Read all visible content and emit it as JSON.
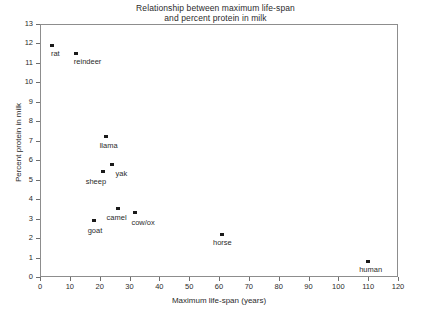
{
  "chart_data": {
    "type": "scatter",
    "title": "Relationship between maximum life-span and percent protein in milk",
    "title_line1": "Relationship between maximum life-span",
    "title_line2": "and percent protein in milk",
    "xlabel": "Maximum life-span (years)",
    "ylabel": "Percent protein in milk",
    "xlim": [
      0,
      120
    ],
    "ylim": [
      0,
      13
    ],
    "xticks": [
      0,
      10,
      20,
      30,
      40,
      50,
      60,
      70,
      80,
      90,
      100,
      110,
      120
    ],
    "yticks": [
      0,
      1,
      2,
      3,
      4,
      5,
      6,
      7,
      8,
      9,
      10,
      11,
      12,
      13
    ],
    "grid": false,
    "legend": "none",
    "marker": "filled-square",
    "marker_color": "#1a1a1a",
    "points": [
      {
        "label": "rat",
        "x": 4,
        "y": 11.9,
        "label_dx": -1,
        "label_dy": 5
      },
      {
        "label": "reindeer",
        "x": 12,
        "y": 11.5,
        "label_dx": -2,
        "label_dy": 5
      },
      {
        "label": "llama",
        "x": 22,
        "y": 7.2,
        "label_dx": -6,
        "label_dy": 5
      },
      {
        "label": "yak",
        "x": 24,
        "y": 5.8,
        "label_dx": 4,
        "label_dy": 6
      },
      {
        "label": "sheep",
        "x": 21,
        "y": 5.4,
        "label_dx": -17,
        "label_dy": 6
      },
      {
        "label": "camel",
        "x": 26,
        "y": 3.5,
        "label_dx": -11,
        "label_dy": 5
      },
      {
        "label": "cow/ox",
        "x": 32,
        "y": 3.3,
        "label_dx": -4,
        "label_dy": 6
      },
      {
        "label": "goat",
        "x": 18,
        "y": 2.9,
        "label_dx": -6,
        "label_dy": 6
      },
      {
        "label": "horse",
        "x": 61,
        "y": 2.2,
        "label_dx": -9,
        "label_dy": 5
      },
      {
        "label": "human",
        "x": 110,
        "y": 0.8,
        "label_dx": -9,
        "label_dy": 5
      }
    ]
  }
}
